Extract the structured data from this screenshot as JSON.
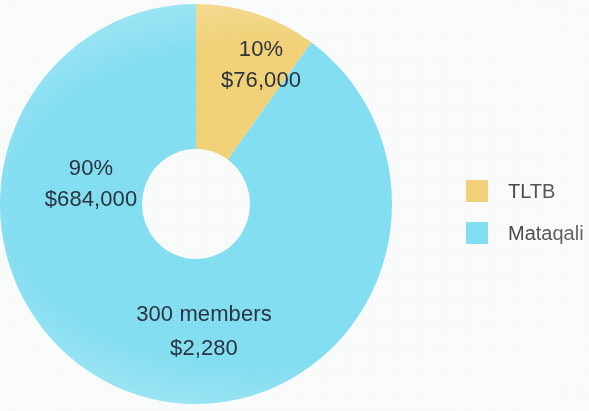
{
  "background_color": "#fdfefe",
  "chart_data": {
    "type": "pie",
    "variant": "donut",
    "title": "",
    "subtitle": "",
    "xlabel": "",
    "ylabel": "",
    "grid": false,
    "legend_position": "right",
    "start_angle_deg": 0,
    "direction": "clockwise",
    "inner_radius_ratio": 0.275,
    "categories": [
      "TLTB",
      "Mataqali"
    ],
    "values": [
      10,
      90
    ],
    "amounts": [
      76000,
      684000
    ],
    "colors": [
      "#f5d579",
      "#85e2f5"
    ],
    "slices": [
      {
        "name": "TLTB",
        "percent": 10,
        "percent_label": "10%",
        "amount": 76000,
        "amount_label": "$76,000",
        "color": "#f5d579",
        "start_angle_deg": 0,
        "end_angle_deg": 36
      },
      {
        "name": "Mataqali",
        "percent": 90,
        "percent_label": "90%",
        "amount": 684000,
        "amount_label": "$684,000",
        "color": "#85e2f5",
        "start_angle_deg": 36,
        "end_angle_deg": 360
      }
    ],
    "annotations": [
      {
        "name": "members-note",
        "line1": "300 members",
        "line2": "$2,280",
        "attached_to": "Mataqali"
      }
    ]
  },
  "labels": {
    "tltb": {
      "percent": "10%",
      "amount": "$76,000"
    },
    "mataqali": {
      "percent": "90%",
      "amount": "$684,000"
    },
    "members": {
      "count": "300 members",
      "amount": "$2,280"
    }
  },
  "legend": {
    "items": [
      {
        "label": "TLTB",
        "color": "#f5d579"
      },
      {
        "label": "Mataqali",
        "color": "#85e2f5"
      }
    ]
  },
  "text_color": "#2b3440",
  "legend_text_color": "#4a4a4a"
}
